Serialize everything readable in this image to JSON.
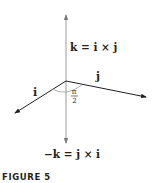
{
  "figure": {
    "caption": "FIGURE 5",
    "labels": {
      "k_top": "k = i × j",
      "j": "j",
      "i": "i",
      "angle_num": "π",
      "angle_den": "2",
      "k_bottom": "−k = j × i"
    },
    "colors": {
      "axis": "#8a8a8a",
      "vector": "#231f20",
      "text": "#231f20"
    }
  }
}
